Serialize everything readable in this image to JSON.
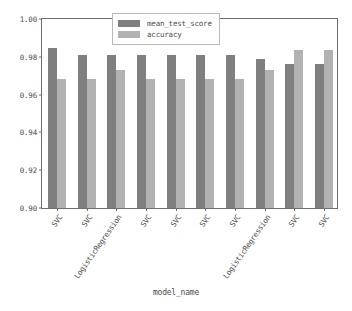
{
  "chart_data": {
    "type": "bar",
    "title": "",
    "xlabel": "model_name",
    "ylabel": "",
    "ylim": [
      0.9,
      1.0
    ],
    "yticks": [
      "1.00",
      "0.98",
      "0.96",
      "0.94",
      "0.92",
      "0.90"
    ],
    "ytick_values": [
      1.0,
      0.98,
      0.96,
      0.94,
      0.92,
      0.9
    ],
    "grid": false,
    "legend_position": "upper center",
    "categories": [
      "SVC",
      "SVC",
      "LogisticRegression",
      "SVC",
      "SVC",
      "SVC",
      "SVC",
      "LogisticRegression",
      "SVC",
      "SVC"
    ],
    "series": [
      {
        "name": "mean_test_score",
        "color": "#7f7f7f",
        "values": [
          0.9846,
          0.981,
          0.981,
          0.981,
          0.981,
          0.981,
          0.981,
          0.9789,
          0.9763,
          0.9763
        ]
      },
      {
        "name": "accuracy",
        "color": "#b2b2b2",
        "values": [
          0.968,
          0.968,
          0.973,
          0.968,
          0.968,
          0.968,
          0.968,
          0.973,
          0.9837,
          0.9837
        ]
      }
    ]
  },
  "legend": {
    "items": [
      {
        "label": "mean_test_score",
        "color": "#7f7f7f"
      },
      {
        "label": "accuracy",
        "color": "#b2b2b2"
      }
    ]
  },
  "axis": {
    "x_title": "model_name"
  }
}
